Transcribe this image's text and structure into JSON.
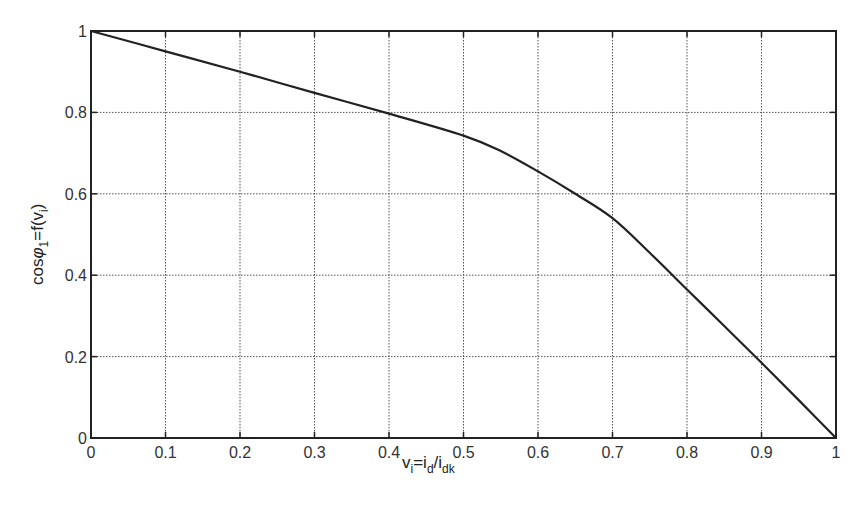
{
  "chart_data": {
    "type": "line",
    "title": "",
    "xlabel": "v_i=i_d/i_dk",
    "ylabel": "cosφ_1=f(v_i)",
    "xlim": [
      0,
      1
    ],
    "ylim": [
      0,
      1
    ],
    "grid": true,
    "legend": null,
    "x_ticks": [
      "0",
      "0.1",
      "0.2",
      "0.3",
      "0.4",
      "0.5",
      "0.6",
      "0.7",
      "0.8",
      "0.9",
      "1"
    ],
    "y_ticks": [
      "0",
      "0.2",
      "0.4",
      "0.6",
      "0.8",
      "1"
    ],
    "x": [
      0,
      0.1,
      0.2,
      0.3,
      0.4,
      0.5,
      0.55,
      0.6,
      0.65,
      0.7,
      0.75,
      0.8,
      0.85,
      0.9,
      0.95,
      1.0
    ],
    "series": [
      {
        "name": "cosφ1",
        "values": [
          1.0,
          0.95,
          0.9,
          0.848,
          0.797,
          0.743,
          0.705,
          0.655,
          0.6,
          0.54,
          0.455,
          0.365,
          0.275,
          0.185,
          0.093,
          0.0
        ],
        "color": "#222222"
      }
    ]
  },
  "labels": {
    "xlabel_main": "v",
    "xlabel_sub1": "i",
    "xlabel_mid": "=i",
    "xlabel_sub2": "d",
    "xlabel_slash": "/i",
    "xlabel_sub3": "dk",
    "ylabel_main": "cos",
    "ylabel_phi": "φ",
    "ylabel_sub1": "1",
    "ylabel_mid": "=f(v",
    "ylabel_sub2": "i",
    "ylabel_end": ")"
  },
  "colors": {
    "axis": "#222222",
    "grid": "#555555",
    "line": "#222222"
  }
}
